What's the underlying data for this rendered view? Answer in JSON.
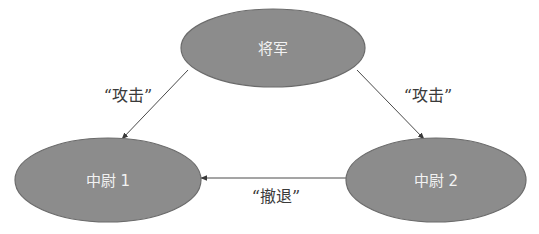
{
  "diagram": {
    "type": "directed-graph",
    "colors": {
      "node_fill": "#8c8c8c",
      "node_stroke": "#6b6b6b",
      "node_text": "#f2f2f2",
      "edge": "#4a4a4a",
      "edge_label": "#3a3a3a",
      "background": "#ffffff"
    },
    "nodes": [
      {
        "id": "general",
        "label": "将军"
      },
      {
        "id": "lieutenant1",
        "label": "中尉 1"
      },
      {
        "id": "lieutenant2",
        "label": "中尉 2"
      }
    ],
    "edges": [
      {
        "from": "general",
        "to": "lieutenant1",
        "label": "“攻击”"
      },
      {
        "from": "general",
        "to": "lieutenant2",
        "label": "“攻击”"
      },
      {
        "from": "lieutenant2",
        "to": "lieutenant1",
        "label": "“撤退”"
      }
    ]
  }
}
